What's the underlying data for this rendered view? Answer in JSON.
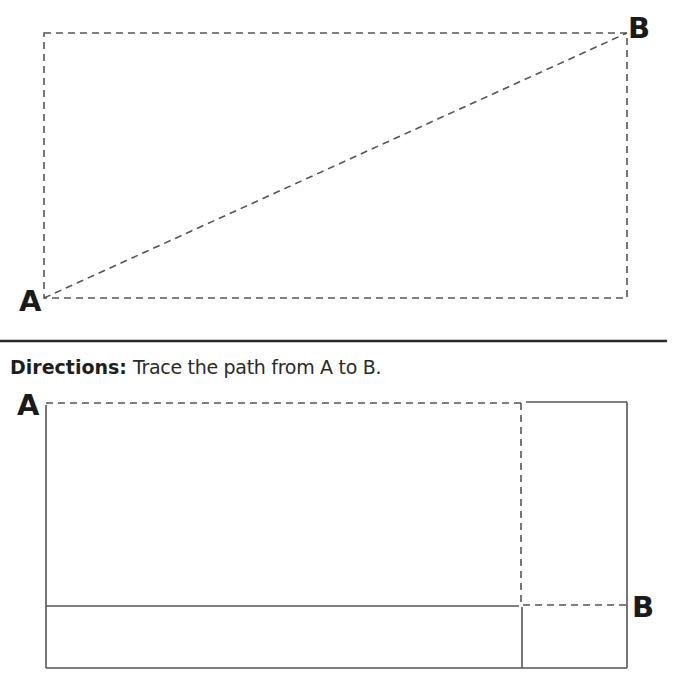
{
  "colors": {
    "line": "#555555",
    "text": "#1e1e1e"
  },
  "top_puzzle": {
    "start_label": "A",
    "end_label": "B"
  },
  "directions": {
    "heading": "Directions:",
    "text": "Trace the path from A to B."
  },
  "bottom_puzzle": {
    "start_label": "A",
    "end_label": "B"
  }
}
